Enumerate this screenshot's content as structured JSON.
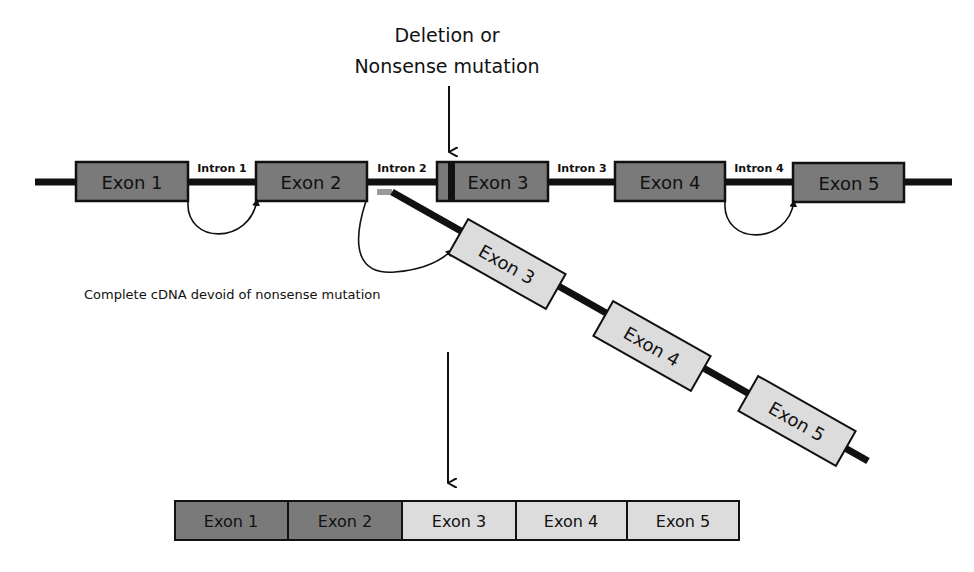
{
  "annotation": {
    "mutation_line1": "Deletion or",
    "mutation_line2": "Nonsense mutation",
    "cdna_note": "Complete cDNA devoid of nonsense mutation"
  },
  "gene": {
    "exons": [
      {
        "label": "Exon 1"
      },
      {
        "label": "Exon 2"
      },
      {
        "label": "Exon 3"
      },
      {
        "label": "Exon 4"
      },
      {
        "label": "Exon 5"
      }
    ],
    "introns": [
      {
        "label": "Intron 1"
      },
      {
        "label": "Intron 2"
      },
      {
        "label": "Intron 3"
      },
      {
        "label": "Intron 4"
      }
    ]
  },
  "cdna": {
    "exons": [
      {
        "label": "Exon 3"
      },
      {
        "label": "Exon 4"
      },
      {
        "label": "Exon 5"
      }
    ]
  },
  "mrna": {
    "exons": [
      {
        "label": "Exon 1"
      },
      {
        "label": "Exon 2"
      },
      {
        "label": "Exon 3"
      },
      {
        "label": "Exon 4"
      },
      {
        "label": "Exon 5"
      }
    ]
  },
  "colors": {
    "genomic_exon": "#7a7a7a",
    "cdna_exon": "#dcdcdc",
    "line": "#111111",
    "primer_stub": "#9a9a9a",
    "background": "#ffffff"
  }
}
